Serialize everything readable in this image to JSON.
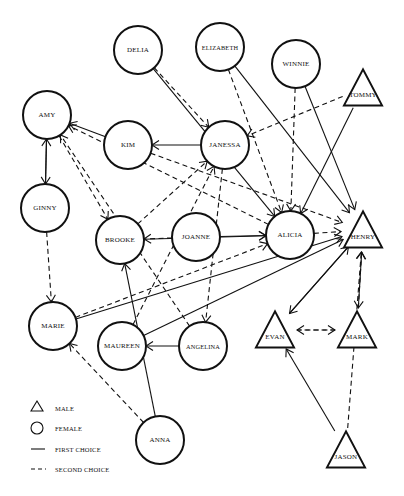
{
  "diagram": {
    "type": "sociogram",
    "nodes": [
      {
        "id": "delia",
        "label": "DELIA",
        "gender": "female",
        "x": 138,
        "y": 50
      },
      {
        "id": "elizabeth",
        "label": "ELIZABETH",
        "gender": "female",
        "x": 220,
        "y": 47
      },
      {
        "id": "winnie",
        "label": "WINNIE",
        "gender": "female",
        "x": 296,
        "y": 64
      },
      {
        "id": "tommy",
        "label": "TOMMY",
        "gender": "male",
        "x": 363,
        "y": 88
      },
      {
        "id": "amy",
        "label": "AMY",
        "gender": "female",
        "x": 47,
        "y": 115
      },
      {
        "id": "kim",
        "label": "KIM",
        "gender": "female",
        "x": 128,
        "y": 145
      },
      {
        "id": "janessa",
        "label": "JANESSA",
        "gender": "female",
        "x": 225,
        "y": 145
      },
      {
        "id": "ginny",
        "label": "GINNY",
        "gender": "female",
        "x": 45,
        "y": 208
      },
      {
        "id": "brooke",
        "label": "BROOKE",
        "gender": "female",
        "x": 120,
        "y": 240
      },
      {
        "id": "joanne",
        "label": "JOANNE",
        "gender": "female",
        "x": 196,
        "y": 237
      },
      {
        "id": "alicia",
        "label": "ALICIA",
        "gender": "female",
        "x": 290,
        "y": 235
      },
      {
        "id": "henry",
        "label": "HENRY",
        "gender": "male",
        "x": 363,
        "y": 230
      },
      {
        "id": "marie",
        "label": "MARIE",
        "gender": "female",
        "x": 53,
        "y": 326
      },
      {
        "id": "maureen",
        "label": "MAUREEN",
        "gender": "female",
        "x": 122,
        "y": 346
      },
      {
        "id": "angelina",
        "label": "ANGELINA",
        "gender": "female",
        "x": 203,
        "y": 346
      },
      {
        "id": "evan",
        "label": "EVAN",
        "gender": "male",
        "x": 275,
        "y": 330
      },
      {
        "id": "mark",
        "label": "MARK",
        "gender": "male",
        "x": 357,
        "y": 330
      },
      {
        "id": "anna",
        "label": "ANNA",
        "gender": "female",
        "x": 160,
        "y": 440
      },
      {
        "id": "jason",
        "label": "JASON",
        "gender": "male",
        "x": 346,
        "y": 450
      }
    ],
    "edges": [
      {
        "from": "delia",
        "to": "alicia",
        "choice": "first"
      },
      {
        "from": "delia",
        "to": "janessa",
        "choice": "second"
      },
      {
        "from": "elizabeth",
        "to": "henry",
        "choice": "first"
      },
      {
        "from": "elizabeth",
        "to": "alicia",
        "choice": "second"
      },
      {
        "from": "winnie",
        "to": "henry",
        "choice": "first"
      },
      {
        "from": "winnie",
        "to": "alicia",
        "choice": "second"
      },
      {
        "from": "tommy",
        "to": "alicia",
        "choice": "first"
      },
      {
        "from": "tommy",
        "to": "janessa",
        "choice": "second"
      },
      {
        "from": "kim",
        "to": "amy",
        "choice": "first"
      },
      {
        "from": "kim",
        "to": "henry",
        "choice": "second"
      },
      {
        "from": "janessa",
        "to": "kim",
        "choice": "first"
      },
      {
        "from": "janessa",
        "to": "angelina",
        "choice": "second"
      },
      {
        "from": "amy",
        "to": "ginny",
        "choice": "first"
      },
      {
        "from": "ginny",
        "to": "amy",
        "choice": "first"
      },
      {
        "from": "amy",
        "to": "brooke",
        "choice": "second"
      },
      {
        "from": "ginny",
        "to": "marie",
        "choice": "second"
      },
      {
        "from": "joanne",
        "to": "alicia",
        "choice": "first"
      },
      {
        "from": "joanne",
        "to": "brooke",
        "choice": "second"
      },
      {
        "from": "brooke",
        "to": "alicia",
        "choice": "first"
      },
      {
        "from": "brooke",
        "to": "janessa",
        "choice": "second"
      },
      {
        "from": "marie",
        "to": "henry",
        "choice": "first"
      },
      {
        "from": "marie",
        "to": "alicia",
        "choice": "second"
      },
      {
        "from": "maureen",
        "to": "henry",
        "choice": "first"
      },
      {
        "from": "maureen",
        "to": "janessa",
        "choice": "second"
      },
      {
        "from": "angelina",
        "to": "maureen",
        "choice": "first"
      },
      {
        "from": "angelina",
        "to": "amy",
        "choice": "second"
      },
      {
        "from": "anna",
        "to": "brooke",
        "choice": "first"
      },
      {
        "from": "anna",
        "to": "marie",
        "choice": "second"
      },
      {
        "from": "alicia",
        "to": "henry",
        "choice": "second"
      },
      {
        "from": "henry",
        "to": "evan",
        "choice": "first"
      },
      {
        "from": "evan",
        "to": "henry",
        "choice": "first"
      },
      {
        "from": "evan",
        "to": "mark",
        "choice": "second"
      },
      {
        "from": "mark",
        "to": "evan",
        "choice": "second"
      },
      {
        "from": "mark",
        "to": "henry",
        "choice": "first"
      },
      {
        "from": "henry",
        "to": "mark",
        "choice": "second"
      },
      {
        "from": "jason",
        "to": "evan",
        "choice": "first"
      },
      {
        "from": "jason",
        "to": "henry",
        "choice": "second"
      },
      {
        "from": "alicia",
        "to": "amy",
        "choice": "second"
      }
    ]
  },
  "legend": {
    "items": [
      {
        "symbol": "triangle",
        "label": "MALE"
      },
      {
        "symbol": "circle",
        "label": "FEMALE"
      },
      {
        "symbol": "solid-line",
        "label": "FIRST CHOICE"
      },
      {
        "symbol": "dashed-line",
        "label": "SECOND CHOICE"
      }
    ]
  },
  "colors": {
    "stroke": "#111111",
    "background": "#ffffff"
  }
}
